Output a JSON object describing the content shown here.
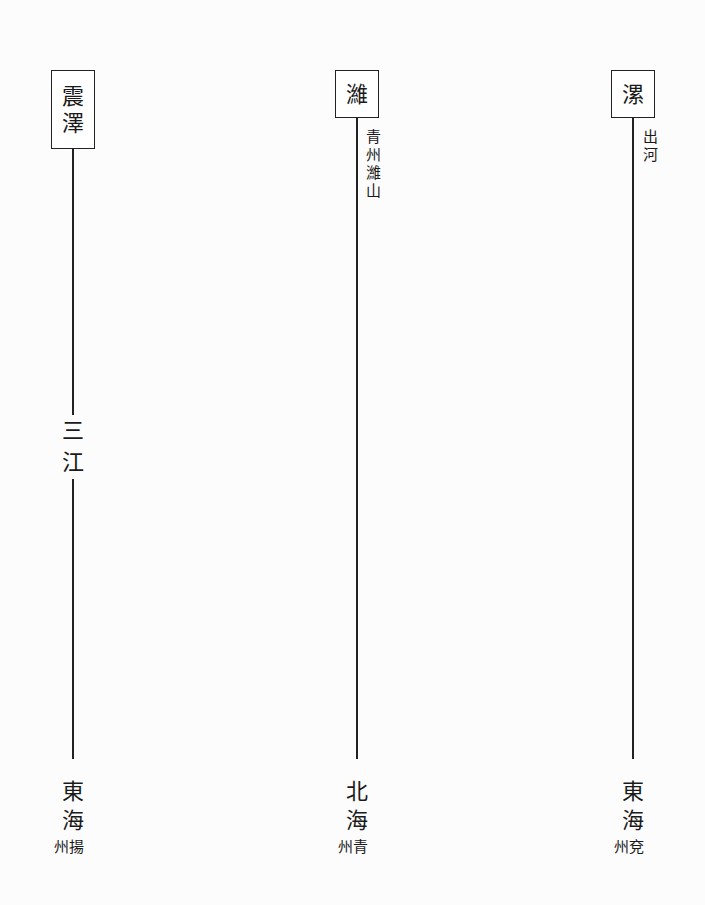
{
  "rivers": [
    {
      "source": [
        "震",
        "澤"
      ],
      "annotation": "",
      "middle": [
        "三",
        "江"
      ],
      "mouth": [
        "東",
        "海"
      ],
      "province": "州揚"
    },
    {
      "source": [
        "濰"
      ],
      "annotation": "青州濰山",
      "middle": [],
      "mouth": [
        "北",
        "海"
      ],
      "province": "州青"
    },
    {
      "source": [
        "漯"
      ],
      "annotation": "出河",
      "middle": [],
      "mouth": [
        "東",
        "海"
      ],
      "province": "州兗"
    }
  ]
}
